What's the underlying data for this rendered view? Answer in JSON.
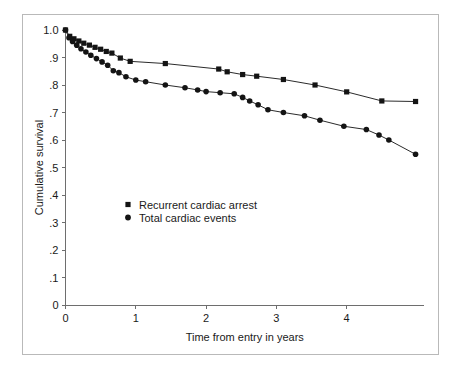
{
  "figure": {
    "background_color": "#ffffff",
    "frame_color": "#b9b9b9",
    "axis_color": "#6e6e6e",
    "series_color": "#141414"
  },
  "chart_data": {
    "type": "line",
    "title": "",
    "xlabel": "Time from entry in years",
    "ylabel": "Cumulative survival",
    "xlim": [
      0,
      5.1
    ],
    "ylim": [
      0,
      1.0
    ],
    "grid": false,
    "legend_position": "inside-left",
    "xticks": [
      0,
      1,
      2,
      3,
      4
    ],
    "xticklabels": [
      "0",
      "1",
      "2",
      "3",
      "4"
    ],
    "yticks": [
      0,
      0.1,
      0.2,
      0.3,
      0.4,
      0.5,
      0.6,
      0.7,
      0.8,
      0.9,
      1.0
    ],
    "yticklabels": [
      "0",
      ".1",
      ".2",
      ".3",
      ".4",
      ".5",
      ".6",
      ".7",
      ".8",
      ".9",
      "1.0"
    ],
    "series": [
      {
        "name": "Recurrent cardiac arrest",
        "marker": "square",
        "x": [
          0.0,
          0.06,
          0.12,
          0.19,
          0.26,
          0.34,
          0.42,
          0.5,
          0.58,
          0.66,
          0.78,
          0.92,
          1.42,
          2.18,
          2.3,
          2.52,
          2.72,
          3.1,
          3.55,
          4.0,
          4.5,
          4.98
        ],
        "y": [
          1.0,
          0.977,
          0.968,
          0.96,
          0.952,
          0.945,
          0.937,
          0.93,
          0.922,
          0.916,
          0.898,
          0.886,
          0.878,
          0.858,
          0.848,
          0.838,
          0.832,
          0.82,
          0.8,
          0.775,
          0.742,
          0.74
        ]
      },
      {
        "name": "Total cardiac events",
        "marker": "circle",
        "x": [
          0.0,
          0.05,
          0.1,
          0.16,
          0.22,
          0.29,
          0.36,
          0.44,
          0.52,
          0.6,
          0.68,
          0.76,
          0.86,
          1.0,
          1.14,
          1.42,
          1.7,
          1.88,
          2.0,
          2.2,
          2.4,
          2.52,
          2.62,
          2.74,
          2.88,
          3.1,
          3.4,
          3.62,
          3.96,
          4.28,
          4.46,
          4.6,
          4.98
        ],
        "y": [
          1.0,
          0.972,
          0.958,
          0.945,
          0.932,
          0.92,
          0.908,
          0.896,
          0.884,
          0.872,
          0.852,
          0.845,
          0.83,
          0.818,
          0.812,
          0.8,
          0.79,
          0.782,
          0.776,
          0.772,
          0.768,
          0.755,
          0.742,
          0.728,
          0.71,
          0.7,
          0.688,
          0.672,
          0.65,
          0.638,
          0.618,
          0.6,
          0.548
        ]
      }
    ]
  },
  "legend": {
    "items": [
      {
        "label": "Recurrent cardiac arrest",
        "marker": "square"
      },
      {
        "label": "Total cardiac events",
        "marker": "circle"
      }
    ]
  }
}
